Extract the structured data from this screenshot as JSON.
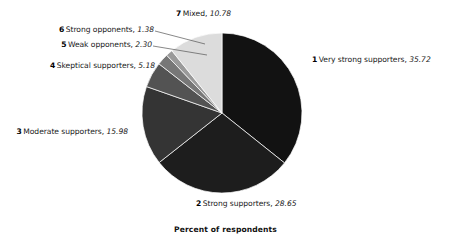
{
  "chart_data": {
    "type": "pie",
    "title": "",
    "subtitle": "",
    "xlabel": "Percent of respondents",
    "ylabel": "",
    "units": "percent",
    "legend_position": "none",
    "grid": false,
    "categories": [
      "Very strong supporters",
      "Strong supporters",
      "Moderate supporters",
      "Skeptical supporters",
      "Weak opponents",
      "Strong opponents",
      "Mixed"
    ],
    "values": [
      35.72,
      28.65,
      15.98,
      5.18,
      2.3,
      1.38,
      10.78
    ],
    "total": 99.99,
    "start_angle_deg": 0,
    "direction": "clockwise",
    "slice_colors": [
      "#121212",
      "#1d1d1d",
      "#343434",
      "#535353",
      "#777777",
      "#9a9a9a",
      "#dcdcdc"
    ],
    "slices": [
      {
        "index": "1",
        "label": "Very strong supporters",
        "value": "35.72",
        "color": "#121212"
      },
      {
        "index": "2",
        "label": "Strong supporters",
        "value": "28.65",
        "color": "#1d1d1d"
      },
      {
        "index": "3",
        "label": "Moderate supporters",
        "value": "15.98",
        "color": "#343434"
      },
      {
        "index": "4",
        "label": "Skeptical supporters",
        "value": "5.18",
        "color": "#535353"
      },
      {
        "index": "5",
        "label": "Weak opponents",
        "value": "2.30",
        "color": "#777777"
      },
      {
        "index": "6",
        "label": "Strong opponents",
        "value": "1.38",
        "color": "#9a9a9a"
      },
      {
        "index": "7",
        "label": "Mixed",
        "value": "10.78",
        "color": "#dcdcdc"
      }
    ]
  },
  "labels": {
    "slice1": {
      "num": "1",
      "name": "Very strong supporters,",
      "value": "35.72"
    },
    "slice2": {
      "num": "2",
      "name": "Strong supporters,",
      "value": "28.65"
    },
    "slice3": {
      "num": "3",
      "name": "Moderate supporters,",
      "value": "15.98"
    },
    "slice4": {
      "num": "4",
      "name": "Skeptical supporters,",
      "value": "5.18"
    },
    "slice5": {
      "num": "5",
      "name": "Weak opponents,",
      "value": "2.30"
    },
    "slice6": {
      "num": "6",
      "name": "Strong opponents,",
      "value": "1.38"
    },
    "slice7": {
      "num": "7",
      "name": "Mixed,",
      "value": "10.78"
    }
  },
  "caption": {
    "text": "Percent of respondents"
  },
  "colors": {
    "background": "#ffffff",
    "text": "#1a1a1a",
    "leader_line": "#555555"
  }
}
